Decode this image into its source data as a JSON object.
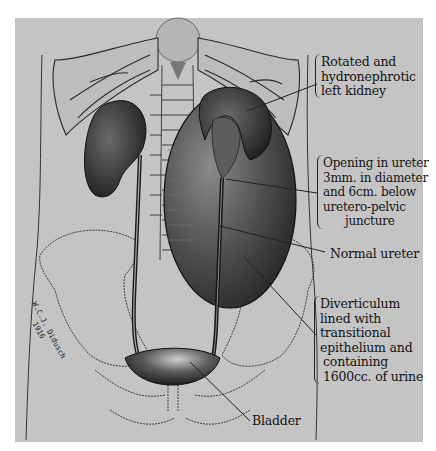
{
  "figure": {
    "type": "medical illustration",
    "background_color": "#c4c4c4",
    "ink_color": "#141414"
  },
  "labels": {
    "kidney": {
      "lines": [
        "Rotated and",
        "hydronephrotic",
        "left kidney"
      ]
    },
    "opening": {
      "lines": [
        "Opening in ureter",
        "3mm. in diameter",
        "and 6cm. below",
        "uretero-pelvic",
        "juncture"
      ]
    },
    "normal_ureter": {
      "lines": [
        "Normal ureter"
      ]
    },
    "diverticulum": {
      "lines": [
        "Diverticulum",
        "lined with",
        "transitional",
        "epithelium and",
        "containing",
        "1600cc. of urine"
      ]
    },
    "bladder": {
      "lines": [
        "Bladder"
      ]
    }
  },
  "signature": {
    "lines": [
      "W.C.J. Didusch",
      "1916"
    ]
  }
}
